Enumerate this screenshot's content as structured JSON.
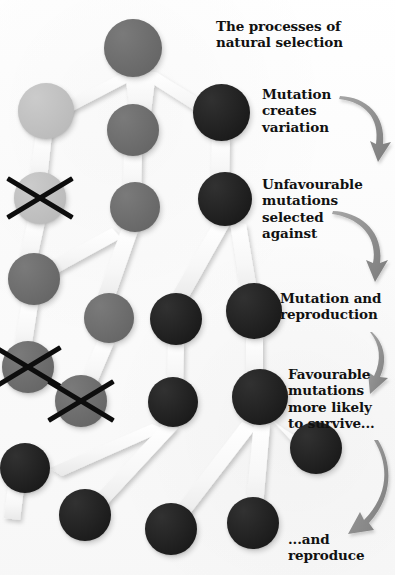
{
  "poster": {
    "title": "The processes of\nnatural selection",
    "background_color": "#fdfdfd",
    "width": 395,
    "height": 575
  },
  "palette": {
    "node_light": "#c5c5c5",
    "node_mid": "#6b6b6b",
    "node_dark": "#1a1a1a",
    "cross_mark": "#0d0d0d",
    "arrow": "#8e8e8e",
    "connector": "#f4f4f4",
    "text": "#111111"
  },
  "steps": [
    {
      "id": "step-1",
      "text": "Mutation\ncreates\nvariation"
    },
    {
      "id": "step-2",
      "text": "Unfavourable\nmutations\nselected\nagainst"
    },
    {
      "id": "step-3",
      "text": "Mutation and\nreproduction"
    },
    {
      "id": "step-4",
      "text": "Favourable\nmutations\nmore likely\nto survive..."
    },
    {
      "id": "step-5",
      "text": "...and\nreproduce"
    }
  ],
  "nodes": [
    {
      "id": "n-gen0-a",
      "shade": "mid",
      "generation": 0,
      "x": 104,
      "y": 19,
      "size": 58,
      "crossed": false
    },
    {
      "id": "n-gen1-a",
      "shade": "light",
      "generation": 1,
      "x": 18,
      "y": 83,
      "size": 56,
      "crossed": false
    },
    {
      "id": "n-gen1-b",
      "shade": "mid",
      "generation": 1,
      "x": 107,
      "y": 104,
      "size": 52,
      "crossed": false
    },
    {
      "id": "n-gen1-c",
      "shade": "dark",
      "generation": 1,
      "x": 193,
      "y": 84,
      "size": 57,
      "crossed": false
    },
    {
      "id": "n-gen2-a",
      "shade": "light",
      "generation": 2,
      "x": 14,
      "y": 172,
      "size": 52,
      "crossed": true
    },
    {
      "id": "n-gen2-b",
      "shade": "mid",
      "generation": 2,
      "x": 110,
      "y": 182,
      "size": 50,
      "crossed": false
    },
    {
      "id": "n-gen2-c",
      "shade": "dark",
      "generation": 2,
      "x": 198,
      "y": 172,
      "size": 54,
      "crossed": false
    },
    {
      "id": "n-gen3-a",
      "shade": "mid",
      "generation": 3,
      "x": 8,
      "y": 253,
      "size": 52,
      "crossed": false
    },
    {
      "id": "n-gen3-b",
      "shade": "mid",
      "generation": 3,
      "x": 84,
      "y": 293,
      "size": 50,
      "crossed": false
    },
    {
      "id": "n-gen3-c",
      "shade": "dark",
      "generation": 3,
      "x": 150,
      "y": 293,
      "size": 52,
      "crossed": false
    },
    {
      "id": "n-gen3-d",
      "shade": "dark",
      "generation": 3,
      "x": 226,
      "y": 283,
      "size": 56,
      "crossed": false
    },
    {
      "id": "n-gen4-a",
      "shade": "mid",
      "generation": 4,
      "x": 2,
      "y": 341,
      "size": 52,
      "crossed": true
    },
    {
      "id": "n-gen4-b",
      "shade": "mid",
      "generation": 4,
      "x": 55,
      "y": 375,
      "size": 52,
      "crossed": true
    },
    {
      "id": "n-gen4-c",
      "shade": "dark",
      "generation": 4,
      "x": 148,
      "y": 377,
      "size": 50,
      "crossed": false
    },
    {
      "id": "n-gen4-d",
      "shade": "dark",
      "generation": 4,
      "x": 232,
      "y": 369,
      "size": 56,
      "crossed": false
    },
    {
      "id": "n-gen5-a",
      "shade": "dark",
      "generation": 5,
      "x": 0,
      "y": 443,
      "size": 50,
      "crossed": false
    },
    {
      "id": "n-gen5-b",
      "shade": "dark",
      "generation": 5,
      "x": 290,
      "y": 422,
      "size": 52,
      "crossed": false
    },
    {
      "id": "n-gen6-a",
      "shade": "dark",
      "generation": 6,
      "x": 59,
      "y": 489,
      "size": 52,
      "crossed": false
    },
    {
      "id": "n-gen6-b",
      "shade": "dark",
      "generation": 6,
      "x": 145,
      "y": 503,
      "size": 52,
      "crossed": false
    },
    {
      "id": "n-gen6-c",
      "shade": "dark",
      "generation": 6,
      "x": 227,
      "y": 497,
      "size": 52,
      "crossed": false
    }
  ],
  "legend": {
    "light_meaning": "light grey individual",
    "mid_meaning": "mid grey individual",
    "dark_meaning": "dark individual"
  }
}
